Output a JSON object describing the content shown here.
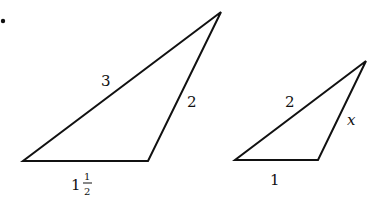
{
  "figure": {
    "bullet": "•",
    "triangles": [
      {
        "name": "large-triangle",
        "vertices": [
          [
            23,
            161
          ],
          [
            148,
            161
          ],
          [
            221,
            12
          ]
        ],
        "labels": {
          "long_side": "3",
          "right_side": "2",
          "base_whole": "1",
          "base_frac_num": "1",
          "base_frac_den": "2"
        }
      },
      {
        "name": "small-triangle",
        "vertices": [
          [
            235,
            160
          ],
          [
            318,
            160
          ],
          [
            366,
            61
          ]
        ],
        "labels": {
          "long_side": "2",
          "right_side": "x",
          "base": "1"
        }
      }
    ],
    "stroke_color": "#111111"
  }
}
